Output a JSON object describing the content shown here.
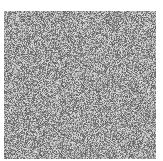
{
  "image": {
    "description": "Grayscale random noise texture square on white background",
    "background_color": "#ffffff",
    "noise": {
      "x": 4,
      "y": 11,
      "width": 152,
      "height": 148,
      "mean_gray": "#9a9a9a",
      "min_gray": 90,
      "max_gray": 225
    }
  }
}
